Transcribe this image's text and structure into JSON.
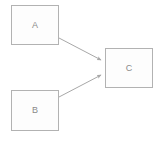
{
  "diagram": {
    "canvas": {
      "width": 160,
      "height": 142,
      "background": "#ffffff"
    },
    "style": {
      "node_fill": "#fdfdfd",
      "node_border": "#b2b2b2",
      "label_color": "#8a8a8a",
      "edge_color": "#a8a8a8"
    },
    "nodes": [
      {
        "id": "a",
        "label": "A",
        "shape": "rectangle",
        "x": 11,
        "y": 5,
        "width": 48,
        "height": 40
      },
      {
        "id": "b",
        "label": "B",
        "shape": "rectangle",
        "x": 11,
        "y": 90,
        "width": 48,
        "height": 41
      },
      {
        "id": "c",
        "label": "C",
        "shape": "rectangle",
        "x": 105,
        "y": 48,
        "width": 48,
        "height": 40
      }
    ],
    "edges": [
      {
        "id": "a-to-c",
        "from": "A",
        "to": "C",
        "label": "",
        "arrowhead": "filled-triangle",
        "x1": 59,
        "y1": 38,
        "x2": 103,
        "y2": 61
      },
      {
        "id": "b-to-c",
        "from": "B",
        "to": "C",
        "label": "",
        "arrowhead": "filled-triangle",
        "x1": 59,
        "y1": 97,
        "x2": 103,
        "y2": 74
      }
    ]
  }
}
